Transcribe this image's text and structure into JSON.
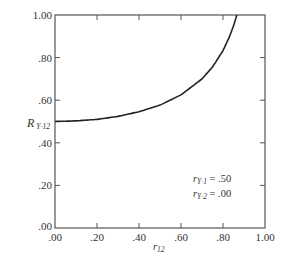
{
  "chart_data": {
    "type": "line",
    "title": "",
    "xlabel": "r12",
    "ylabel": "R Y·12",
    "xlim": [
      0,
      1
    ],
    "ylim": [
      0,
      1
    ],
    "grid": false,
    "x_ticks": [
      ".00",
      ".20",
      ".40",
      ".60",
      ".80",
      "1.00"
    ],
    "y_ticks": [
      ".00",
      ".20",
      ".40",
      ".60",
      ".80",
      "1.00"
    ],
    "series": [
      {
        "name": "R Y·12",
        "x": [
          0.0,
          0.1,
          0.2,
          0.3,
          0.4,
          0.5,
          0.6,
          0.7,
          0.75,
          0.8,
          0.83,
          0.85,
          0.866
        ],
        "values": [
          0.5,
          0.503,
          0.51,
          0.524,
          0.546,
          0.577,
          0.625,
          0.7,
          0.756,
          0.833,
          0.896,
          0.949,
          1.0
        ]
      }
    ],
    "annotations": [
      {
        "label": "rY-1",
        "value": ".50"
      },
      {
        "label": "rY-2",
        "value": ".00"
      }
    ]
  },
  "axes": {
    "x_label_main": "r",
    "x_label_sub": "12",
    "y_label_main": "R",
    "y_label_sub": "Y·12"
  },
  "annotation": {
    "line1_main": "r",
    "line1_sub": "Y·1",
    "line1_eq": " = .50",
    "line2_main": "r",
    "line2_sub": "Y·2",
    "line2_eq": " = .00"
  },
  "colors": {
    "axis": "#555555",
    "curve": "#222222",
    "text": "#333333"
  }
}
